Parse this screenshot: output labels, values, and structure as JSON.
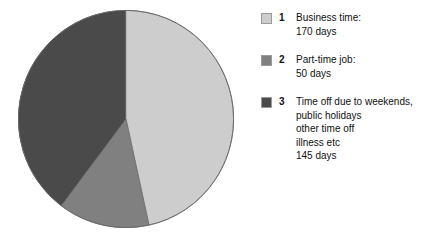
{
  "chart_data": {
    "type": "pie",
    "title": "",
    "subtitle": "",
    "unit": "days",
    "total": 365,
    "legend_position": "right",
    "start_angle_deg": 0,
    "direction": "clockwise",
    "categories": [
      "Business time",
      "Part-time job",
      "Time off due to weekends, public holidays other time off illness etc"
    ],
    "values": [
      170,
      50,
      145
    ],
    "colors": [
      "#cdcdcd",
      "#808080",
      "#4a4a4a"
    ],
    "slices": [
      {
        "index": "1",
        "label": "Business time:",
        "value": 170,
        "value_label": "170 days",
        "color": "#cdcdcd",
        "angle_deg": 167.7,
        "percent": 46.6
      },
      {
        "index": "2",
        "label": "Part-time job:",
        "value": 50,
        "value_label": "50 days",
        "color": "#808080",
        "angle_deg": 49.3,
        "percent": 13.7
      },
      {
        "index": "3",
        "label": "Time off due to weekends, public holidays other time off illness etc",
        "value": 145,
        "value_label": "145 days",
        "color": "#4a4a4a",
        "angle_deg": 143.0,
        "percent": 39.7
      }
    ]
  },
  "legend": {
    "items": [
      {
        "index": "1",
        "text": "Business time:\n170 days",
        "color": "#cdcdcd"
      },
      {
        "index": "2",
        "text": "Part-time job:\n50 days",
        "color": "#808080"
      },
      {
        "index": "3",
        "text": "Time off due to weekends,\npublic holidays\nother time off\nillness etc\n145 days",
        "color": "#4a4a4a"
      }
    ]
  }
}
